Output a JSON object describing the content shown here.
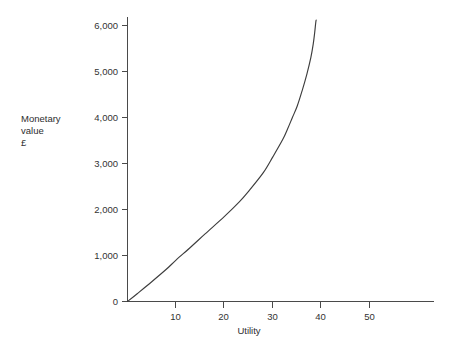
{
  "chart_data": {
    "type": "line",
    "title": "",
    "subtitle": "",
    "xlabel": "Utility",
    "ylabel": "Monetary value £",
    "ylabel_lines": [
      "Monetary",
      "value",
      "£"
    ],
    "xlim": [
      0,
      59
    ],
    "ylim": [
      0,
      6200
    ],
    "xticks": [
      10,
      20,
      30,
      40,
      50
    ],
    "xtick_labels": [
      "10",
      "20",
      "30",
      "40",
      "50"
    ],
    "yticks": [
      0,
      1000,
      2000,
      3000,
      4000,
      5000,
      6000
    ],
    "ytick_labels": [
      "0",
      "1,000",
      "2,000",
      "3,000",
      "4,000",
      "5,000",
      "6,000"
    ],
    "grid": false,
    "legend": null,
    "series": [
      {
        "name": "Utility curve",
        "color": "#3d3d3d",
        "x": [
          0,
          2,
          5,
          8,
          10,
          13,
          16,
          20,
          23,
          25,
          28,
          30,
          32,
          33,
          34,
          35,
          36,
          37,
          37.8,
          38.3,
          38.6,
          38.8,
          38.9
        ],
        "y": [
          0,
          170,
          430,
          700,
          900,
          1180,
          1470,
          1850,
          2160,
          2400,
          2800,
          3150,
          3520,
          3750,
          4000,
          4250,
          4580,
          4950,
          5300,
          5600,
          5850,
          6050,
          6120
        ]
      }
    ],
    "annotations": []
  },
  "axis": {
    "line_color": "#4a4a4a",
    "text_color": "#333333"
  },
  "xaxis_title": "Utility",
  "yaxis_title_line1": "Monetary",
  "yaxis_title_line2": "value",
  "yaxis_title_line3": "£"
}
